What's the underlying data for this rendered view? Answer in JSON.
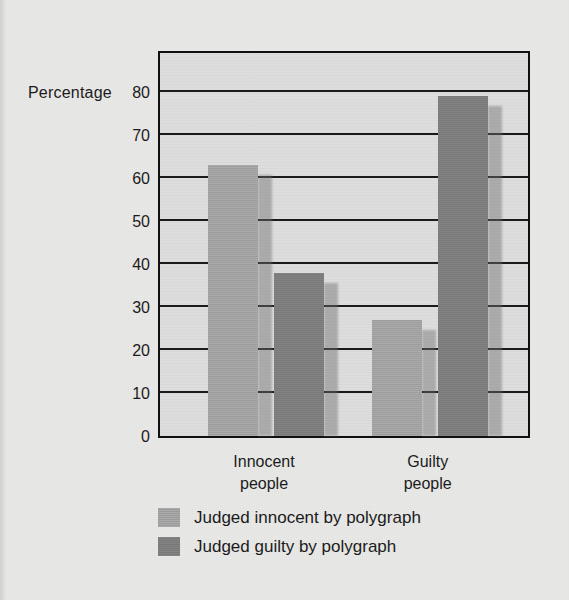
{
  "chart_data": {
    "type": "bar",
    "title": "",
    "xlabel": "",
    "ylabel": "Percentage",
    "ylim": [
      0,
      90
    ],
    "ytick_values": [
      0,
      10,
      20,
      30,
      40,
      50,
      60,
      70,
      80
    ],
    "ytick_labels": [
      "0",
      "10",
      "20",
      "30",
      "40",
      "50",
      "60",
      "70",
      "80"
    ],
    "grid": true,
    "legend_position": "bottom-left",
    "categories": [
      "Innocent people",
      "Guilty people"
    ],
    "category_lines": [
      [
        "Innocent",
        "people"
      ],
      [
        "Guilty",
        "people"
      ]
    ],
    "series": [
      {
        "name": "Judged innocent by polygraph",
        "color": "#a5a5a5",
        "values": [
          63,
          27
        ]
      },
      {
        "name": "Judged guilty by polygraph",
        "color": "#7e7e7e",
        "values": [
          38,
          79
        ]
      }
    ]
  },
  "colors": {
    "page_background": "#e9e9e7",
    "plot_background": "#dcdcdc",
    "frame": "#101010",
    "gridline": "#1a1a1a",
    "text": "#1b1b1b",
    "series_light": "#a5a5a5",
    "series_dark": "#7e7e7e"
  }
}
